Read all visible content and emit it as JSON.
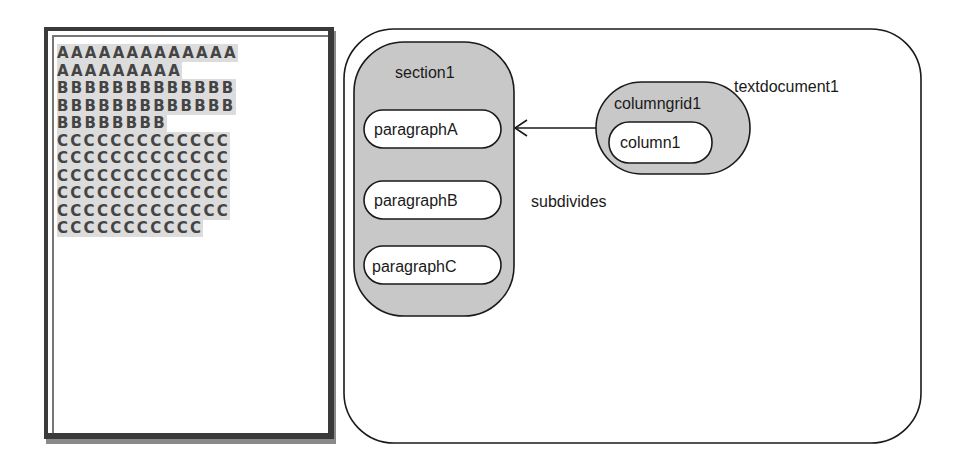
{
  "page_preview": {
    "lines": [
      "AAAAAAAAAAAAA",
      "AAAAAAAAA",
      "BBBBBBBBBBBBB",
      "BBBBBBBBBBBBB",
      "BBBBBBBB",
      "CCCCCCCCCCCCC",
      "CCCCCCCCCCCCC",
      "CCCCCCCCCCCCC",
      "CCCCCCCCCCCCC",
      "CCCCCCCCCCCCC",
      "CCCCCCCCCCC"
    ],
    "highlight_color": "#dcdcdc",
    "text_color": "#444444"
  },
  "diagram": {
    "container": {
      "label": "textdocument1"
    },
    "section": {
      "label": "section1",
      "fill": "#c8c8c8",
      "children": [
        {
          "label": "paragraphA"
        },
        {
          "label": "paragraphB"
        },
        {
          "label": "paragraphC"
        }
      ]
    },
    "columngrid": {
      "label": "columngrid1",
      "fill": "#c8c8c8",
      "children": [
        {
          "label": "column1"
        }
      ]
    },
    "relation": {
      "label": "subdivides",
      "from": "columngrid1",
      "to": "section1"
    }
  }
}
